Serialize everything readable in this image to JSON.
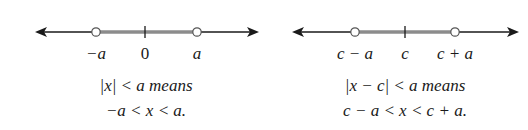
{
  "diagrams": [
    {
      "id": "abs-x",
      "ticks": [
        "−a",
        "0",
        "a"
      ],
      "caption_line1": "|x| < a means",
      "caption_line2": "−a < x < a."
    },
    {
      "id": "abs-x-minus-c",
      "ticks": [
        "c − a",
        "c",
        "c + a"
      ],
      "caption_line1": "|x − c| < a means",
      "caption_line2": "c − a < x < c + a."
    }
  ],
  "colors": {
    "axis": "#1a1a1a",
    "interval": "#8c8c8c",
    "open_circle_fill": "#ffffff"
  }
}
